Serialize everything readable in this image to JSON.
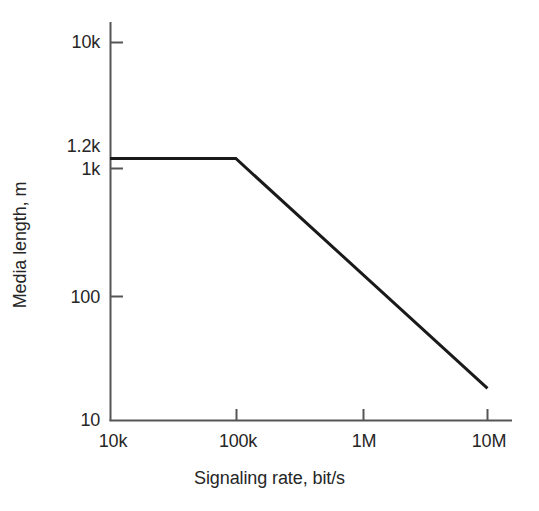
{
  "chart_data": {
    "type": "line",
    "title": "",
    "subtitle": "",
    "xlabel": "Signaling rate, bit/s",
    "ylabel": "Media length, m",
    "xscale": "log",
    "yscale": "log",
    "xlim": [
      10000,
      20000000
    ],
    "ylim": [
      10,
      10000
    ],
    "xtick_labels": [
      "10k",
      "100k",
      "1M",
      "10M"
    ],
    "xtick_values": [
      10000,
      100000,
      1000000,
      10000000
    ],
    "ytick_labels": [
      "10k",
      "1.2k",
      "1k",
      "100",
      "10"
    ],
    "ytick_values": [
      10000,
      1200,
      1000,
      100,
      10
    ],
    "grid": false,
    "legend": null,
    "annotations": [],
    "series": [
      {
        "name": "Maximum media length vs signaling rate",
        "color": "#1a1a1a",
        "linewidth": 3,
        "x": [
          10000,
          100000,
          10000000
        ],
        "y": [
          1200,
          1200,
          18
        ],
        "points": [
          {
            "x": 10000,
            "y": 1200,
            "x_label": "10k",
            "y_label": "1.2k"
          },
          {
            "x": 100000,
            "y": 1200,
            "x_label": "100k",
            "y_label": "1.2k"
          },
          {
            "x": 10000000,
            "y": 18,
            "x_label": "10M",
            "y_label": "18"
          }
        ]
      }
    ]
  },
  "axes": {
    "y_title": "Media length, m",
    "x_title": "Signaling rate, bit/s",
    "y_ticks": [
      {
        "label": "10k",
        "value": 10000
      },
      {
        "label": "1.2k",
        "value": 1200
      },
      {
        "label": "1k",
        "value": 1000
      },
      {
        "label": "100",
        "value": 100
      },
      {
        "label": "10",
        "value": 10
      }
    ],
    "x_ticks": [
      {
        "label": "10k",
        "value": 10000
      },
      {
        "label": "100k",
        "value": 100000
      },
      {
        "label": "1M",
        "value": 1000000
      },
      {
        "label": "10M",
        "value": 10000000
      }
    ]
  },
  "colors": {
    "background": "#ffffff",
    "axis": "#555555",
    "data_line": "#1a1a1a",
    "text": "#262626"
  }
}
